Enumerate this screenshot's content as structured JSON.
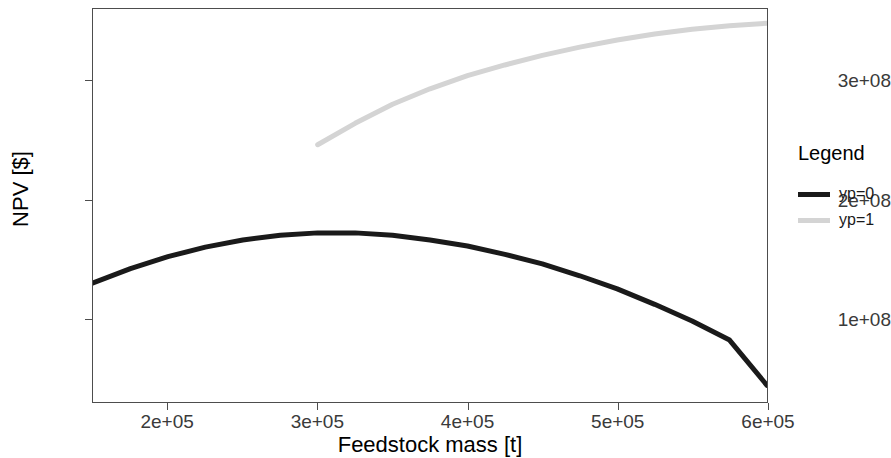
{
  "chart_data": {
    "type": "line",
    "title": "",
    "xlabel": "Feedstock mass [t]",
    "ylabel": "NPV [$]",
    "xlim": [
      150000,
      600000
    ],
    "ylim": [
      30000000,
      360000000
    ],
    "xticks": [
      "2e+05",
      "3e+05",
      "4e+05",
      "5e+05",
      "6e+05"
    ],
    "xtick_values": [
      200000,
      300000,
      400000,
      500000,
      600000
    ],
    "yticks": [
      "1e+08",
      "2e+08",
      "3e+08"
    ],
    "ytick_values": [
      100000000,
      200000000,
      300000000
    ],
    "grid": false,
    "legend_position": "right",
    "legend_title": "Legend",
    "series": [
      {
        "name": "yp=0",
        "color": "#1a1a1a",
        "x": [
          150000,
          175000,
          200000,
          225000,
          250000,
          275000,
          300000,
          325000,
          350000,
          375000,
          400000,
          425000,
          450000,
          475000,
          500000,
          525000,
          550000,
          575000,
          600000
        ],
        "y": [
          130000000,
          142000000,
          152000000,
          160000000,
          166000000,
          170000000,
          172000000,
          172000000,
          170000000,
          166000000,
          161000000,
          154000000,
          146000000,
          136000000,
          125000000,
          112000000,
          98000000,
          82000000,
          44000000
        ]
      },
      {
        "name": "yp=1",
        "color": "#d4d4d4",
        "x": [
          300000,
          325000,
          350000,
          375000,
          400000,
          425000,
          450000,
          475000,
          500000,
          525000,
          550000,
          575000,
          600000
        ],
        "y": [
          246000000,
          264000000,
          280000000,
          293000000,
          304000000,
          313000000,
          321000000,
          328000000,
          334000000,
          339000000,
          343000000,
          346000000,
          348000000
        ]
      }
    ]
  },
  "axes": {
    "y_title": "NPV [$]",
    "x_title": "Feedstock mass [t]"
  },
  "legend": {
    "title": "Legend",
    "items": [
      {
        "label": "yp=0",
        "color": "#1a1a1a"
      },
      {
        "label": "yp=1",
        "color": "#d4d4d4"
      }
    ]
  }
}
